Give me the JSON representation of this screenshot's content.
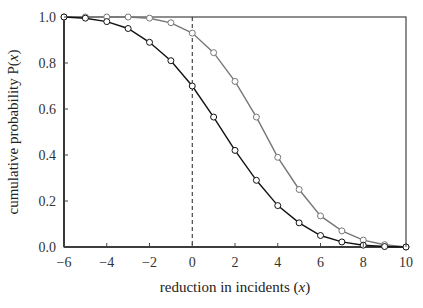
{
  "chart_data": {
    "type": "line",
    "title": "",
    "xlabel": "reduction in incidents (x)",
    "xlabel_parts": [
      "reduction in incidents (",
      "x",
      ")"
    ],
    "ylabel": "cumulative probability P(x)",
    "ylabel_parts": [
      "cumulative probability P(",
      "x",
      ")"
    ],
    "xlim": [
      -6,
      10
    ],
    "ylim": [
      0,
      1
    ],
    "xticks": [
      -6,
      -4,
      -2,
      0,
      2,
      4,
      6,
      8,
      10
    ],
    "xtick_labels": [
      "−6",
      "−4",
      "−2",
      "0",
      "2",
      "4",
      "6",
      "8",
      "10"
    ],
    "yticks": [
      0,
      0.2,
      0.4,
      0.6,
      0.8,
      1.0
    ],
    "ytick_labels": [
      "0.0",
      "0.2",
      "0.4",
      "0.6",
      "0.8",
      "1.0"
    ],
    "grid": false,
    "legend": null,
    "reference_line": {
      "type": "vertical",
      "x": 0,
      "style": "dashed",
      "color": "#222222"
    },
    "x": [
      -6,
      -5,
      -4,
      -3,
      -2,
      -1,
      0,
      1,
      2,
      3,
      4,
      5,
      6,
      7,
      8,
      9,
      10
    ],
    "series": [
      {
        "name": "black curve",
        "color": "#111111",
        "marker": "open-circle",
        "values": [
          1.0,
          0.995,
          0.98,
          0.95,
          0.89,
          0.81,
          0.7,
          0.565,
          0.42,
          0.29,
          0.18,
          0.105,
          0.05,
          0.022,
          0.008,
          0.002,
          0.0
        ]
      },
      {
        "name": "gray curve",
        "color": "#777777",
        "marker": "open-circle",
        "values": [
          1.0,
          1.0,
          1.0,
          1.0,
          0.995,
          0.975,
          0.93,
          0.845,
          0.72,
          0.565,
          0.39,
          0.25,
          0.135,
          0.07,
          0.03,
          0.01,
          0.0
        ]
      }
    ]
  }
}
